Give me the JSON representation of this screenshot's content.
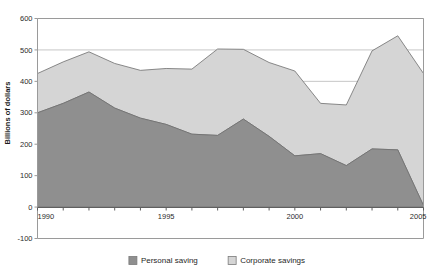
{
  "chart_data": {
    "type": "area",
    "stacked": true,
    "title": "",
    "xlabel": "",
    "ylabel": "Billions of dollars",
    "x": [
      1990,
      1991,
      1992,
      1993,
      1994,
      1995,
      1996,
      1997,
      1998,
      1999,
      2000,
      2001,
      2002,
      2003,
      2004,
      2005
    ],
    "xlim": [
      1990,
      2005
    ],
    "ylim": [
      -100,
      600
    ],
    "xticks": [
      1990,
      1991,
      1992,
      1993,
      1994,
      1995,
      1996,
      1997,
      1998,
      1999,
      2000,
      2001,
      2002,
      2003,
      2004,
      2005
    ],
    "xticklabels": [
      "1990",
      "",
      "",
      "",
      "",
      "1995",
      "",
      "",
      "",
      "",
      "2000",
      "",
      "",
      "",
      "",
      "2005"
    ],
    "yticks": [
      -100,
      0,
      100,
      200,
      300,
      400,
      500,
      600
    ],
    "yticklabels": [
      "-100",
      "0",
      "100",
      "200",
      "300",
      "400",
      "500",
      "600"
    ],
    "grid": true,
    "grid_axis": "y",
    "legend_position": "bottom",
    "series": [
      {
        "name": "Personal saving",
        "color": "#8f8f8f",
        "values": [
          300,
          330,
          366,
          315,
          283,
          263,
          232,
          228,
          280,
          225,
          163,
          170,
          132,
          185,
          182,
          5
        ]
      },
      {
        "name": "Corporate savings",
        "color": "#d5d5d5",
        "values": [
          125,
          132,
          128,
          142,
          152,
          178,
          207,
          275,
          222,
          235,
          270,
          160,
          193,
          312,
          363,
          420
        ]
      }
    ],
    "totals": [
      425,
      462,
      494,
      457,
      435,
      441,
      439,
      503,
      502,
      460,
      433,
      330,
      325,
      497,
      545,
      425
    ]
  },
  "legend": {
    "items": [
      {
        "label": "Personal saving",
        "color": "#8f8f8f"
      },
      {
        "label": "Corporate savings",
        "color": "#d5d5d5"
      }
    ]
  },
  "axes": {
    "y_title": "Billions of dollars"
  },
  "style": {
    "plot_border": "#9a9a9a",
    "gridline": "#b9b9b9",
    "series_outline": "#6e6e6e",
    "background": "#ffffff"
  }
}
